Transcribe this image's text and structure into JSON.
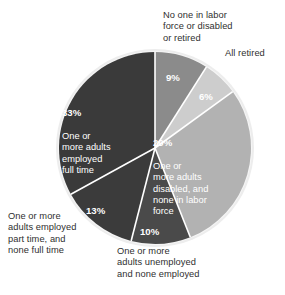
{
  "chart_data": {
    "type": "pie",
    "title": "",
    "subtitle": "",
    "xlabel": "",
    "ylabel": "",
    "legend_position": "none",
    "grid": false,
    "units": "percent",
    "total": 100,
    "categories": [
      "No one in labor force or disabled or retired",
      "All retired",
      "One or more adults disabled, and none in labor force",
      "One or more adults unemployed and none employed",
      "One or more adults employed part time, and none full time",
      "One or more adults employed full time"
    ],
    "values": [
      9,
      6,
      29,
      10,
      13,
      33
    ],
    "value_labels": [
      "9%",
      "6%",
      "29%",
      "10%",
      "13%",
      "33%"
    ],
    "colors": [
      "#8b8b8b",
      "#cdcdcd",
      "#b2b2b2",
      "#4a4a4a",
      "#3b3b3b",
      "#3a3a3a"
    ],
    "slices": [
      {
        "id": "no-one-in-labor-force",
        "percent_label": "9%",
        "value": 9,
        "label": "No one in labor force or disabled or retired",
        "label_placement": "outside-top",
        "color": "#8b8b8b",
        "label_color": "#2f2f2f",
        "percent_color": "#ffffff"
      },
      {
        "id": "all-retired",
        "percent_label": "6%",
        "value": 6,
        "label": "All retired",
        "label_placement": "outside-right",
        "color": "#cdcdcd",
        "label_color": "#2f2f2f",
        "percent_color": "#ffffff"
      },
      {
        "id": "adults-disabled-none-in-labor-force",
        "percent_label": "29%",
        "value": 29,
        "label": "One or more adults disabled, and none in labor force",
        "label_placement": "inside",
        "color": "#b2b2b2",
        "label_color": "#ffffff",
        "percent_color": "#ffffff"
      },
      {
        "id": "adults-unemployed-none-employed",
        "percent_label": "10%",
        "value": 10,
        "label": "One or more adults unemployed and none employed",
        "label_placement": "outside-bottom",
        "color": "#4a4a4a",
        "label_color": "#2f2f2f",
        "percent_color": "#ffffff"
      },
      {
        "id": "adults-employed-part-time",
        "percent_label": "13%",
        "value": 13,
        "label": "One or more adults employed part time, and none full time",
        "label_placement": "outside-left",
        "color": "#3b3b3b",
        "label_color": "#2f2f2f",
        "percent_color": "#ffffff"
      },
      {
        "id": "adults-employed-full-time",
        "percent_label": "33%",
        "value": 33,
        "label": "One or more adults employed full time",
        "label_placement": "inside",
        "color": "#3a3a3a",
        "label_color": "#ffffff",
        "percent_color": "#ffffff"
      }
    ]
  },
  "labels": {
    "no_one_in_labor_force": "No one in labor\nforce or disabled\nor retired",
    "all_retired": "All retired",
    "part_time": "One or more\nadults employed\npart time, and\nnone full time",
    "unemployed": "One or more\nadults unemployed\nand none employed",
    "inside_29_pct": "29%",
    "inside_29_text": "One or\nmore adults\ndisabled, and\nnone in labor\nforce",
    "inside_33_pct": "33%",
    "inside_33_text": "One or\nmore adults\nemployed\nfull time",
    "pct_9": "9%",
    "pct_6": "6%",
    "pct_13": "13%",
    "pct_10": "10%"
  },
  "style": {
    "background": "#ffffff",
    "separator": "#ffffff",
    "ring": "#e3e3e3"
  }
}
